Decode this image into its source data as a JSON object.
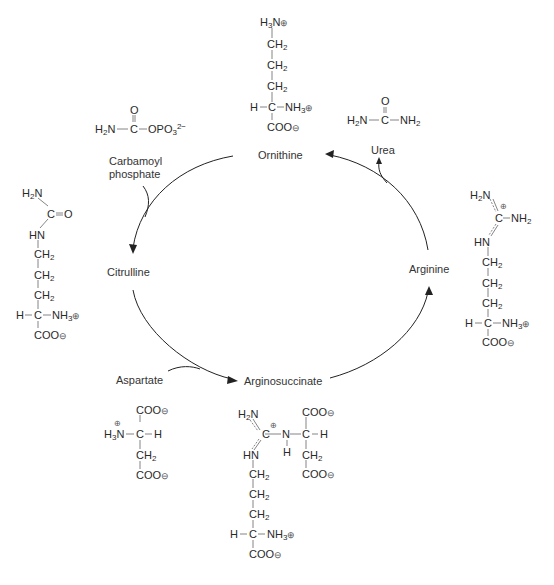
{
  "diagram": {
    "cycle_nodes": [
      {
        "id": "ornithine",
        "label": "Ornithine"
      },
      {
        "id": "citrulline",
        "label": "Citrulline"
      },
      {
        "id": "arginosuccinate",
        "label": "Arginosuccinate"
      },
      {
        "id": "arginine",
        "label": "Arginine"
      }
    ],
    "inputs": [
      {
        "id": "carbamoyl-phosphate",
        "label_line1": "Carbamoyl",
        "label_line2": "phosphate",
        "enters_between": [
          "ornithine",
          "citrulline"
        ]
      },
      {
        "id": "aspartate",
        "label": "Aspartate",
        "enters_between": [
          "citrulline",
          "arginosuccinate"
        ]
      }
    ],
    "outputs": [
      {
        "id": "urea",
        "label": "Urea",
        "leaves_between": [
          "arginine",
          "ornithine"
        ]
      }
    ],
    "edges": [
      {
        "from": "ornithine",
        "to": "citrulline"
      },
      {
        "from": "citrulline",
        "to": "arginosuccinate"
      },
      {
        "from": "arginosuccinate",
        "to": "arginine"
      },
      {
        "from": "arginine",
        "to": "ornithine"
      }
    ],
    "structures": {
      "ornithine": [
        "H3N⊕",
        "CH2",
        "CH2",
        "CH2",
        "H—C—NH3⊕",
        "COO⊖"
      ],
      "carbamoyl_phosphate": [
        "O",
        "H2N—C—OPO3 2−"
      ],
      "urea": [
        "O",
        "H2N—C—NH2"
      ],
      "citrulline": [
        "H2N",
        "C=O",
        "HN",
        "CH2",
        "CH2",
        "CH2",
        "H—C—NH3⊕",
        "COO⊖"
      ],
      "arginine": [
        "H2N",
        "⊕",
        "C—NH2",
        "HN",
        "CH2",
        "CH2",
        "CH2",
        "H—C—NH3⊕",
        "COO⊖"
      ],
      "aspartate": [
        "COO⊖",
        "⊕",
        "H3N—C—H",
        "CH2",
        "COO⊖"
      ],
      "arginosuccinate": [
        "H2N",
        "COO⊖",
        "⊕",
        "C—N—C—H",
        "HN",
        "H",
        "CH2",
        "COO⊖",
        "CH2",
        "CH2",
        "CH2",
        "H—C—NH3⊕",
        "COO⊖"
      ]
    }
  }
}
